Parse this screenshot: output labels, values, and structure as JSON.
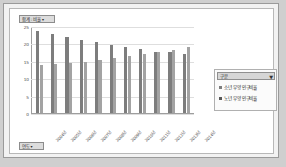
{
  "pivot": {
    "value_field_label": "합계 : 비율",
    "value_field_caret": "▾",
    "row_field_label": "연도",
    "row_field_caret": "▾"
  },
  "legend": {
    "header_label": "구분",
    "filter_icon": "filter-icon",
    "items": [
      {
        "label": "소년 부양 인구비율",
        "color": "#7d7d7d"
      },
      {
        "label": "노년 부양 인구비율",
        "color": "#585858"
      }
    ]
  },
  "chart_data": {
    "type": "bar",
    "title": "합계 : 비율",
    "xlabel": "연도",
    "ylabel": "",
    "ylim": [
      0,
      25
    ],
    "yticks": [
      0,
      5,
      10,
      15,
      20,
      25
    ],
    "grid": true,
    "legend_position": "right",
    "categories": [
      "2004년",
      "2005년",
      "2006년",
      "2007년",
      "2008년",
      "2009년",
      "2010년",
      "2011년",
      "2012년",
      "2013년",
      "2014년"
    ],
    "series": [
      {
        "name": "소년 부양 인구비율",
        "color": "#7d7d7d",
        "values": [
          23.5,
          22.6,
          21.7,
          21.0,
          20.3,
          19.6,
          19.0,
          18.3,
          17.6,
          17.4,
          17.1
        ]
      },
      {
        "name": "노년 부양 인구비율",
        "color": "#a3a3a3",
        "values": [
          13.9,
          14.2,
          14.4,
          14.7,
          15.2,
          15.9,
          16.3,
          17.1,
          17.6,
          18.2,
          19.1
        ]
      }
    ]
  }
}
